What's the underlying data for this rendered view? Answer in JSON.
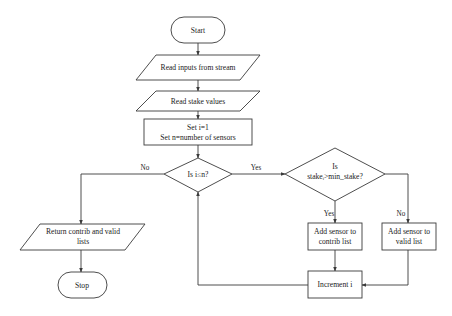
{
  "diagram": {
    "type": "flowchart",
    "stroke_color": "#3a3a3a",
    "fill_color": "#ffffff",
    "text_color": "#222222",
    "nodes": {
      "start": {
        "shape": "terminator",
        "lines": [
          "Start"
        ]
      },
      "read_inputs": {
        "shape": "parallelogram",
        "lines": [
          "Read inputs from stream"
        ]
      },
      "read_stake": {
        "shape": "parallelogram",
        "lines": [
          "Read stake values"
        ]
      },
      "init": {
        "shape": "process",
        "lines": [
          "Set i=1",
          "Set n=number of sensors"
        ]
      },
      "loop_check": {
        "shape": "decision",
        "lines": [
          "Is i≤n?"
        ]
      },
      "stake_check": {
        "shape": "decision",
        "lines": [
          "Is",
          "stakeᵢ>min_stake?"
        ]
      },
      "add_contrib": {
        "shape": "process",
        "lines": [
          "Add sensor to",
          "contrib list"
        ]
      },
      "add_valid": {
        "shape": "process",
        "lines": [
          "Add sensor to",
          "valid list"
        ]
      },
      "increment": {
        "shape": "process",
        "lines": [
          "Increment i"
        ]
      },
      "return_lists": {
        "shape": "parallelogram",
        "lines": [
          "Return contrib and valid",
          "lists"
        ]
      },
      "stop": {
        "shape": "terminator",
        "lines": [
          "Stop"
        ]
      }
    },
    "edges": [
      {
        "from": "start",
        "to": "read_inputs",
        "label": ""
      },
      {
        "from": "read_inputs",
        "to": "read_stake",
        "label": ""
      },
      {
        "from": "read_stake",
        "to": "init",
        "label": ""
      },
      {
        "from": "init",
        "to": "loop_check",
        "label": ""
      },
      {
        "from": "loop_check",
        "to": "stake_check",
        "label": "Yes"
      },
      {
        "from": "loop_check",
        "to": "return_lists",
        "label": "No"
      },
      {
        "from": "stake_check",
        "to": "add_contrib",
        "label": "Yes"
      },
      {
        "from": "stake_check",
        "to": "add_valid",
        "label": "No"
      },
      {
        "from": "add_contrib",
        "to": "increment",
        "label": ""
      },
      {
        "from": "add_valid",
        "to": "increment",
        "label": ""
      },
      {
        "from": "increment",
        "to": "loop_check",
        "label": ""
      },
      {
        "from": "return_lists",
        "to": "stop",
        "label": ""
      }
    ],
    "edge_labels": {
      "loop_yes": "Yes",
      "loop_no": "No",
      "stake_yes": "Yes",
      "stake_no": "No"
    }
  }
}
